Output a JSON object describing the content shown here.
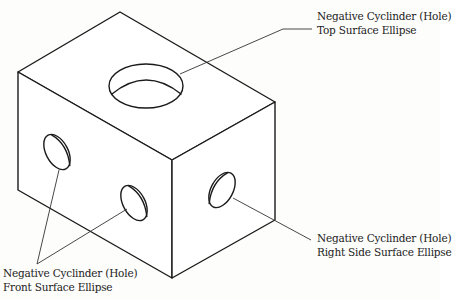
{
  "diagram": {
    "type": "isometric-technical-drawing",
    "colors": {
      "stroke": "#1a1a1a",
      "leader": "#333333",
      "text": "#222222",
      "background": "#fdfdfc"
    },
    "callouts": {
      "top": {
        "line1": "Negative Cyclinder (Hole)",
        "line2": "Top Surface Ellipse"
      },
      "right": {
        "line1": "Negative Cyclinder (Hole)",
        "line2": "Right Side Surface Ellipse"
      },
      "front": {
        "line1": "Negative Cyclinder (Hole)",
        "line2": "Front Surface Ellipse"
      }
    }
  }
}
